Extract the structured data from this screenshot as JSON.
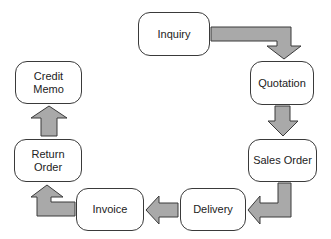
{
  "diagram": {
    "type": "process-cycle",
    "colors": {
      "node_fill": "#ffffff",
      "node_border": "#3a3a3a",
      "arrow_fill": "#a9a9a9",
      "arrow_border": "#3a3a3a",
      "text": "#222222"
    },
    "nodes": [
      {
        "id": "inquiry",
        "label": "Inquiry"
      },
      {
        "id": "quotation",
        "label": "Quotation"
      },
      {
        "id": "sales_order",
        "label": "Sales Order"
      },
      {
        "id": "delivery",
        "label": "Delivery"
      },
      {
        "id": "invoice",
        "label": "Invoice"
      },
      {
        "id": "return_order",
        "label": "Return\nOrder"
      },
      {
        "id": "credit_memo",
        "label": "Credit\nMemo"
      }
    ],
    "edges": [
      {
        "from": "inquiry",
        "to": "quotation"
      },
      {
        "from": "quotation",
        "to": "sales_order"
      },
      {
        "from": "sales_order",
        "to": "delivery"
      },
      {
        "from": "delivery",
        "to": "invoice"
      },
      {
        "from": "invoice",
        "to": "return_order"
      },
      {
        "from": "return_order",
        "to": "credit_memo"
      }
    ]
  }
}
